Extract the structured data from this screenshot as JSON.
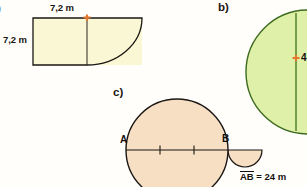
{
  "page": {
    "width": 307,
    "height": 187,
    "background": "#fffefb",
    "kind": "geometry-exercise-figures"
  },
  "colors": {
    "shape_a_fill": "#f9f7d4",
    "shape_b_fill": "#dff0a8",
    "shape_c_fill": "#f7dfc3",
    "outline": "#1a1613",
    "shape_b_outline": "#3d6b1f",
    "tick_orange": "#e2772f",
    "text": "#15110e"
  },
  "items": {
    "a_label": ")",
    "b_label": "b)",
    "c_label": "c)"
  },
  "shape_a": {
    "name": "rectangle-with-quarter-circle",
    "top_dimension": "7,2 m",
    "left_dimension": "7,2 m",
    "fill": "#f9f7d4",
    "divider_tick": "orange-cross-tick"
  },
  "shape_b": {
    "name": "circle-with-radius",
    "radius_label": "4",
    "fill": "#dff0a8",
    "outline": "#3d6b1f",
    "radius_tick": "orange-cross-tick"
  },
  "shape_c": {
    "name": "circle-with-chord-and-small-semicircle",
    "point_a": "A",
    "point_b": "B",
    "chord_ticks": 2,
    "fill": "#f7dfc3",
    "caption_overline": "AB",
    "caption_rest": " = 24 m"
  }
}
